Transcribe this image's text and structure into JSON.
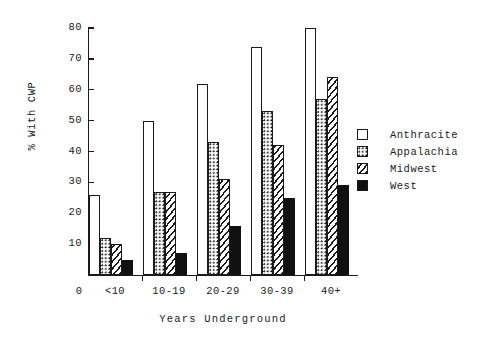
{
  "chart_data": {
    "type": "bar",
    "title": "",
    "xlabel": "Years Underground",
    "ylabel": "% With CWP",
    "categories": [
      "<10",
      "10-19",
      "20-29",
      "30-39",
      "40+"
    ],
    "ylim": [
      0,
      80
    ],
    "yticks": [
      0,
      10,
      20,
      30,
      40,
      50,
      60,
      70,
      80
    ],
    "grid": false,
    "legend_position": "right",
    "series": [
      {
        "name": "Anthracite",
        "fill": "empty",
        "values": [
          26,
          50,
          62,
          74,
          80
        ]
      },
      {
        "name": "Appalachia",
        "fill": "dots",
        "values": [
          12,
          27,
          43,
          53,
          57
        ]
      },
      {
        "name": "Midwest",
        "fill": "hatch",
        "values": [
          10,
          27,
          31,
          42,
          64
        ]
      },
      {
        "name": "West",
        "fill": "solid",
        "values": [
          5,
          7,
          16,
          25,
          29
        ]
      }
    ]
  },
  "axis": {
    "y_tick_labels": [
      "80",
      "70",
      "60",
      "50",
      "40",
      "30",
      "20",
      "10"
    ],
    "origin_label": "0"
  },
  "legend": {
    "items": [
      {
        "label": "Anthracite"
      },
      {
        "label": "Appalachia"
      },
      {
        "label": "Midwest"
      },
      {
        "label": "West"
      }
    ]
  }
}
